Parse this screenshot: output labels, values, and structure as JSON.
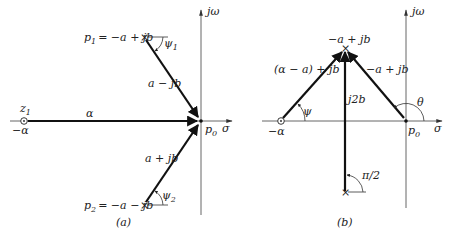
{
  "figure": {
    "panel_a": {
      "caption": "(a)",
      "axes": {
        "x_label": "σ",
        "y_label": "jω"
      },
      "points": {
        "p1": {
          "label": "p",
          "sub": "1",
          "expr": "= −a + jb"
        },
        "p2": {
          "label": "p",
          "sub": "2",
          "expr": "= −a − jb"
        },
        "p0": {
          "label": "p",
          "sub": "0"
        },
        "z1": {
          "label": "z",
          "sub": "1",
          "value": "−α"
        }
      },
      "vectors": {
        "from_p1": "a − jb",
        "from_p2": "a + jb",
        "from_z1": "α"
      },
      "angles": {
        "psi1": {
          "label": "ψ",
          "sub": "1"
        },
        "psi2": {
          "label": "ψ",
          "sub": "2"
        }
      }
    },
    "panel_b": {
      "caption": "(b)",
      "axes": {
        "x_label": "σ",
        "y_label": "jω"
      },
      "points": {
        "top_pole": "−a + jb",
        "zero": "−α",
        "p0": {
          "label": "p",
          "sub": "0"
        }
      },
      "vectors": {
        "from_zero": "(α − a) + jb",
        "from_p0": "−a + jb",
        "from_bottom": "j2b"
      },
      "angles": {
        "psi": "ψ",
        "theta": "θ",
        "right_angle": "π/2"
      }
    }
  }
}
